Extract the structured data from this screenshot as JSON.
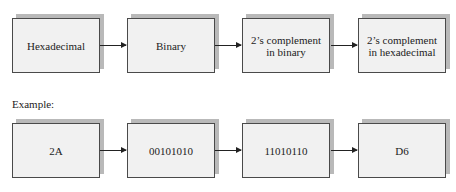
{
  "flow": {
    "steps": [
      {
        "label": "Hexadecimal"
      },
      {
        "label": "Binary"
      },
      {
        "label": "2’s complement\nin binary"
      },
      {
        "label": "2’s complement\nin hexadecimal"
      }
    ]
  },
  "example": {
    "heading": "Example:",
    "steps": [
      {
        "label": "2A"
      },
      {
        "label": "00101010"
      },
      {
        "label": "11010110"
      },
      {
        "label": "D6"
      }
    ]
  }
}
